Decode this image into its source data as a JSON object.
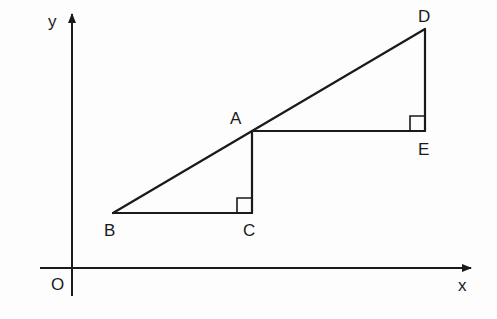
{
  "diagram": {
    "type": "geometry",
    "axes": {
      "x_label": "x",
      "y_label": "y",
      "origin_label": "O"
    },
    "points": {
      "A": {
        "label": "A"
      },
      "B": {
        "label": "B"
      },
      "C": {
        "label": "C"
      },
      "D": {
        "label": "D"
      },
      "E": {
        "label": "E"
      }
    },
    "segments": [
      "BD",
      "BC",
      "CA",
      "AE",
      "ED"
    ],
    "right_angles": [
      "C",
      "E"
    ],
    "colors": {
      "stroke": "#1a1a1a",
      "background": "#ffffff"
    }
  }
}
